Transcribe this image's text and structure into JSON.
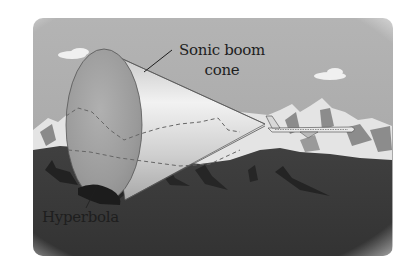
{
  "figure": {
    "labels": {
      "cone_line1": "Sonic boom",
      "cone_line2": "cone",
      "hyperbola": "Hyperbola"
    },
    "colors": {
      "sky": "#a8a8a8",
      "mountain_snow": "#e6e6e6",
      "mountain_rock": "#8a8a8a",
      "ground": "#3c3c3c",
      "ground_dark": "#262626",
      "cone_base": "#9a9a9a",
      "cone_side": "#d8d8d8",
      "text": "#1e1e1e",
      "background": "#ffffff"
    }
  }
}
